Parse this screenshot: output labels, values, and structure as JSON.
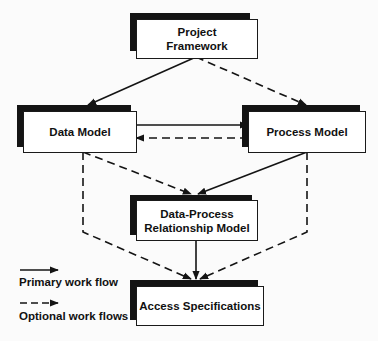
{
  "diagram": {
    "nodes": [
      {
        "id": "project-framework",
        "label_line1": "Project",
        "label_line2": "Framework"
      },
      {
        "id": "data-model",
        "label": "Data Model"
      },
      {
        "id": "process-model",
        "label": "Process Model"
      },
      {
        "id": "data-process-relationship-model",
        "label_line1": "Data-Process",
        "label_line2": "Relationship Model"
      },
      {
        "id": "access-specifications",
        "label": "Access Specifications"
      }
    ],
    "edges": [
      {
        "from": "project-framework",
        "to": "data-model",
        "style": "solid"
      },
      {
        "from": "project-framework",
        "to": "process-model",
        "style": "dashed"
      },
      {
        "from": "data-model",
        "to": "process-model",
        "style": "solid"
      },
      {
        "from": "process-model",
        "to": "data-model",
        "style": "dashed"
      },
      {
        "from": "data-model",
        "to": "data-process-relationship-model",
        "style": "dashed"
      },
      {
        "from": "process-model",
        "to": "data-process-relationship-model",
        "style": "solid"
      },
      {
        "from": "data-model",
        "to": "access-specifications",
        "style": "dashed"
      },
      {
        "from": "process-model",
        "to": "access-specifications",
        "style": "dashed"
      },
      {
        "from": "data-process-relationship-model",
        "to": "access-specifications",
        "style": "solid"
      }
    ]
  },
  "legend": {
    "primary": "Primary work flow",
    "optional": "Optional work flows"
  },
  "colors": {
    "ink": "#141414",
    "box_fill": "#ffffff",
    "background": "#fbfbfb"
  }
}
